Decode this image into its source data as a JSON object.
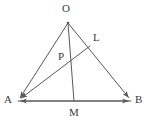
{
  "figure": {
    "kind": "geometry-diagram",
    "background_color": "#ffffff",
    "stroke_color": "#585858",
    "label_color": "#3a3a3a",
    "stroke_width": 1,
    "canvas": {
      "width": 148,
      "height": 123
    },
    "points": [
      {
        "id": "O",
        "label": "O",
        "x": 68,
        "y": 23,
        "label_x": 63,
        "label_y": 4,
        "marked": true
      },
      {
        "id": "A",
        "label": "A",
        "x": 18,
        "y": 101,
        "label_x": 4,
        "label_y": 95,
        "marked": true
      },
      {
        "id": "B",
        "label": "B",
        "x": 131,
        "y": 101,
        "label_x": 135,
        "label_y": 95,
        "marked": true
      },
      {
        "id": "M",
        "label": "M",
        "x": 74,
        "y": 101,
        "label_x": 70,
        "label_y": 108,
        "marked": false
      },
      {
        "id": "L",
        "label": "L",
        "x": 90,
        "y": 46,
        "label_x": 94,
        "label_y": 33,
        "marked": false
      },
      {
        "id": "P",
        "label": "P",
        "x": 71,
        "y": 60,
        "label_x": 59,
        "label_y": 52,
        "marked": false
      }
    ],
    "segments": [
      {
        "id": "OA",
        "from": "O",
        "to": "A",
        "arrow_at_end": true
      },
      {
        "id": "OB",
        "from": "O",
        "to": "B",
        "arrow_at_end": true
      },
      {
        "id": "OM",
        "from": "O",
        "to": "M",
        "arrow_at_end": false
      },
      {
        "id": "AB",
        "from": "A",
        "to": "B",
        "arrow_at_start": true,
        "arrow_at_end": true
      },
      {
        "id": "AL",
        "from": "A",
        "to": "L",
        "arrow_at_start": true,
        "arrow_at_end": false
      }
    ]
  }
}
